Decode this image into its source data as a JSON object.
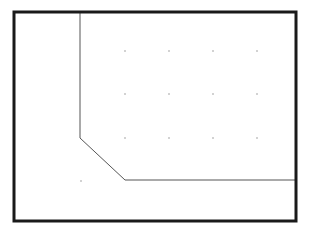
{
  "diagram": {
    "background": "#ffffff",
    "frame": {
      "x": 14,
      "y": 12,
      "width": 282,
      "height": 209,
      "stroke": "#1a1a1a",
      "stroke_width": 3
    },
    "path": {
      "points": [
        [
          80,
          13
        ],
        [
          80,
          138
        ],
        [
          125,
          180
        ],
        [
          295,
          180
        ]
      ],
      "stroke": "#555555",
      "stroke_width": 1
    },
    "grid_dots": {
      "color": "#9a9a9a",
      "radius": 0.8,
      "points": [
        [
          125,
          51
        ],
        [
          169,
          51
        ],
        [
          213,
          51
        ],
        [
          257,
          51
        ],
        [
          125,
          94
        ],
        [
          169,
          94
        ],
        [
          213,
          94
        ],
        [
          257,
          94
        ],
        [
          125,
          138
        ],
        [
          169,
          138
        ],
        [
          213,
          138
        ],
        [
          257,
          138
        ],
        [
          81,
          181
        ]
      ]
    }
  }
}
